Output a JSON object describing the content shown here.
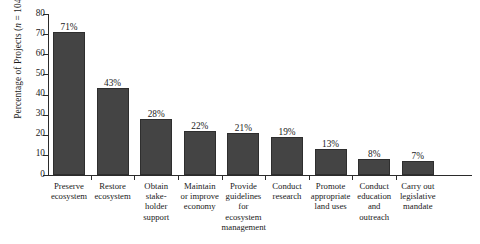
{
  "chart_data": {
    "type": "bar",
    "title": "",
    "xlabel": "",
    "ylabel": "Percentage of Projects (n = 104)",
    "ylabel_prefix": "Percentage of Projects (",
    "ylabel_italic": "n",
    "ylabel_suffix": " = 104)",
    "sample_size": 104,
    "ylim": [
      0,
      80
    ],
    "ytick_step": 10,
    "yticks": [
      0,
      10,
      20,
      30,
      40,
      50,
      60,
      70,
      80
    ],
    "grid": false,
    "legend": false,
    "units": "percent",
    "categories": [
      "Preserve ecosystem",
      "Restore ecosystem",
      "Obtain stakeholder support",
      "Maintain or improve economy",
      "Provide guidelines for ecosystem management",
      "Conduct research",
      "Promote appropriate land uses",
      "Conduct education and outreach",
      "Carry out legislative mandate"
    ],
    "category_lines": [
      [
        "Preserve",
        "ecosystem"
      ],
      [
        "Restore",
        "ecosystem"
      ],
      [
        "Obtain",
        "stake-",
        "holder",
        "support"
      ],
      [
        "Maintain",
        "or improve",
        "economy"
      ],
      [
        "Provide",
        "guidelines",
        "for",
        "ecosystem",
        "management"
      ],
      [
        "Conduct",
        "research"
      ],
      [
        "Promote",
        "appropriate",
        "land uses"
      ],
      [
        "Conduct",
        "education",
        "and",
        "outreach"
      ],
      [
        "Carry out",
        "legislative",
        "mandate"
      ]
    ],
    "values": [
      71,
      43,
      28,
      22,
      21,
      19,
      13,
      8,
      7
    ],
    "value_labels": [
      "71%",
      "43%",
      "28%",
      "22%",
      "21%",
      "19%",
      "13%",
      "8%",
      "7%"
    ],
    "bar_color": "#444444",
    "bar_edge_color": "#2e2e2e",
    "axis_color": "#2b2b2b",
    "text_color": "#1a1a1a",
    "background_color": "#ffffff"
  }
}
